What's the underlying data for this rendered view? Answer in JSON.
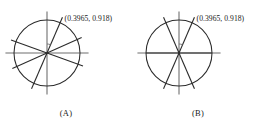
{
  "figure": {
    "background_color": "#ffffff",
    "stroke_color": "#2b2b2b",
    "axis_color": "#6f6f6f",
    "point_label": "(0.3965, 0.918)",
    "panels": [
      {
        "id": "A",
        "caption": "(A)",
        "coord_label": "(0.3965, 0.918)",
        "center": {
          "x": 47,
          "y": 53
        },
        "radius": 33,
        "axes": {
          "horizontal_label": "x-axis",
          "vertical_label": "y-axis"
        },
        "point": {
          "x": 0.3965,
          "y": 0.918,
          "angle_deg": 66.6
        },
        "lines": [
          {
            "name": "line-1",
            "angle_deg": 66.6,
            "extend": 1.18
          },
          {
            "name": "line-2",
            "angle_deg": 24.0,
            "extend": 1.15
          },
          {
            "name": "line-3",
            "angle_deg": 160.0,
            "extend": 1.16
          }
        ],
        "angle_arc": {
          "from_deg": 66.6,
          "to_deg": 90,
          "radius": 9
        }
      },
      {
        "id": "B",
        "caption": "(B)",
        "coord_label": "(0.3965, 0.918)",
        "center": {
          "x": 47,
          "y": 53
        },
        "radius": 33,
        "axes": {
          "horizontal_label": "x-axis",
          "vertical_label": "y-axis"
        },
        "point": {
          "x": 0.3965,
          "y": 0.918,
          "angle_deg": 66.6
        },
        "lines": [
          {
            "name": "line-1",
            "angle_deg": 66.6,
            "extend": 1.18
          },
          {
            "name": "line-2",
            "angle_deg": 113.4,
            "extend": 1.18
          },
          {
            "name": "line-3",
            "angle_deg": 0.0,
            "extend": 1.0
          }
        ],
        "angle_arc": {
          "from_deg": 66.6,
          "to_deg": 90,
          "radius": 9
        }
      }
    ]
  },
  "chart_data": {
    "type": "scatter",
    "xlabel": "",
    "ylabel": "",
    "xlim": [
      -1.2,
      1.2
    ],
    "ylim": [
      -1.2,
      1.2
    ],
    "grid": false,
    "legend": "none",
    "annotations": [
      "(0.3965, 0.918)",
      "(A)",
      "(B)"
    ],
    "panels": [
      {
        "name": "(A)",
        "circle_radius": 1.0,
        "marked_point": [
          0.3965,
          0.918
        ],
        "line_angles_deg": [
          66.6,
          24.0,
          160.0
        ]
      },
      {
        "name": "(B)",
        "circle_radius": 1.0,
        "marked_point": [
          0.3965,
          0.918
        ],
        "line_angles_deg": [
          66.6,
          113.4,
          0.0
        ]
      }
    ]
  }
}
